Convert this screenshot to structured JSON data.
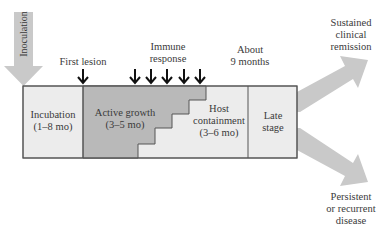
{
  "inoculation": {
    "label": "Inoculation"
  },
  "markers": {
    "first_lesion": "First lesion",
    "immune_response": [
      "Immune",
      "response"
    ],
    "about_9_months": [
      "About",
      "9 months"
    ]
  },
  "stages": [
    {
      "id": "incubation",
      "lines": [
        "Incubation",
        "(1–8 mo)"
      ]
    },
    {
      "id": "active-growth",
      "lines": [
        "Active growth",
        "(3–5 mo)"
      ]
    },
    {
      "id": "host-containment",
      "lines": [
        "Host",
        "containment",
        "(3–6 mo)"
      ]
    },
    {
      "id": "late-stage",
      "lines": [
        "Late",
        "stage"
      ]
    }
  ],
  "outcomes": {
    "remission": [
      "Sustained",
      "clinical",
      "remission"
    ],
    "persistent": [
      "Persistent",
      "or recurrent",
      "disease"
    ]
  },
  "colors": {
    "light_fill": "#ececec",
    "dark_fill": "#b9b9b9",
    "arrow_gray": "#c4c4c4",
    "outline": "#555555",
    "black_arrow": "#111111"
  }
}
